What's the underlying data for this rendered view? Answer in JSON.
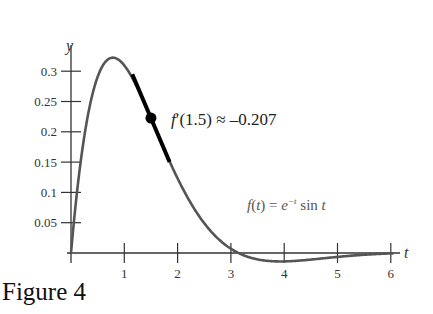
{
  "caption": "Figure 4",
  "chart_data": {
    "type": "line",
    "title": "",
    "xlabel": "t",
    "ylabel": "y",
    "xlim": [
      0,
      6.1
    ],
    "ylim": [
      0,
      0.32
    ],
    "grid": false,
    "x_ticks": [
      1,
      2,
      3,
      4,
      5,
      6
    ],
    "x_tick_labels": [
      "1",
      "2",
      "3",
      "4",
      "5",
      "6"
    ],
    "y_ticks": [
      0.05,
      0.1,
      0.15,
      0.2,
      0.25,
      0.3
    ],
    "y_tick_labels": [
      "0.05",
      "0.1",
      "0.15",
      "0.2",
      "0.25",
      "0.3"
    ],
    "series": [
      {
        "name": "f(t) = e^-t sin t",
        "function": "exp(-t)*sin(t)",
        "x": [
          0,
          0.25,
          0.5,
          0.785,
          1.0,
          1.25,
          1.5,
          1.75,
          2.0,
          2.5,
          3.0,
          3.14,
          3.5,
          3.93,
          4.5,
          5.0,
          5.5,
          6.0
        ],
        "values": [
          0,
          0.193,
          0.291,
          0.322,
          0.31,
          0.272,
          0.223,
          0.171,
          0.123,
          0.049,
          0.007,
          0.0,
          -0.011,
          -0.014,
          -0.011,
          -0.006,
          -0.003,
          -0.001
        ]
      }
    ],
    "tangent": {
      "at_t": 1.5,
      "point_y": 0.2226,
      "slope": -0.207,
      "t_range": [
        1.15,
        1.85
      ]
    },
    "annotations": [
      {
        "text": "f′(1.5) ≈ –0.207",
        "near": [
          1.6,
          0.225
        ]
      },
      {
        "text": "f(t) = e",
        "sup": "−t",
        "suffix": " sin t",
        "near": [
          3.3,
          0.07
        ]
      }
    ]
  }
}
